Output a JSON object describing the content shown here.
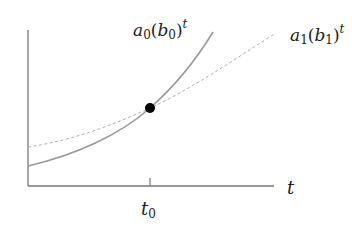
{
  "diagram": {
    "title": "",
    "x_axis_label": "t",
    "tick_label": "t0",
    "curves": [
      {
        "name": "a0(b0)^t",
        "base": "a",
        "base_sub": "0",
        "paren": "b",
        "paren_sub": "0",
        "exp": "t",
        "style": "solid",
        "color": "#9a9a9a"
      },
      {
        "name": "a1(b1)^t",
        "base": "a",
        "base_sub": "1",
        "paren": "b",
        "paren_sub": "1",
        "exp": "t",
        "style": "dashed",
        "color": "#b0b0b0"
      }
    ],
    "intersection": {
      "label": "t0",
      "color": "#000000"
    },
    "axis_color": "#777777"
  }
}
